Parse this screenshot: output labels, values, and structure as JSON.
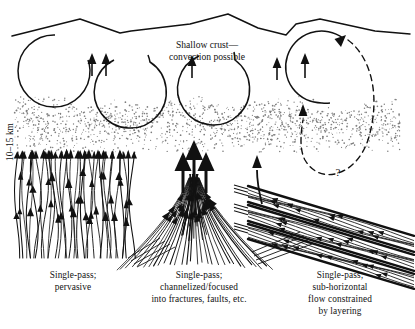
{
  "figure": {
    "title_line1": "Shallow crust—",
    "title_line2": "convection possible",
    "depth_label": "10–15 km",
    "uncertainty_marker": "?",
    "background_color": "#ffffff",
    "ink_color": "#111111"
  },
  "panels": [
    {
      "id": "left",
      "name": "pervasive-flow-panel",
      "caption_line1": "Single-pass;",
      "caption_line2": "pervasive",
      "caption_line3": "",
      "caption_line4": "",
      "flow_style": "wavy vertical lines, arrowheads pointing up"
    },
    {
      "id": "center",
      "name": "channelized-flow-panel",
      "caption_line1": "Single-pass;",
      "caption_line2": "channelized/focused",
      "caption_line3": "into fractures, faults, etc.",
      "caption_line4": "",
      "flow_style": "fan converging upward into large arrows"
    },
    {
      "id": "right",
      "name": "layered-flow-panel",
      "caption_line1": "Single-pass;",
      "caption_line2": "sub-horizontal",
      "caption_line3": "flow constrained",
      "caption_line4": "by layering",
      "flow_style": "tilted parallel layers with leftward arrows"
    }
  ],
  "features": {
    "surface_profile": "jagged topographic ground surface",
    "convection_cells": 4,
    "stipple_band": "speckled transition zone at 10-15 km depth",
    "dashed_return_loop": "hypothetical deep circulation, labelled ?"
  }
}
